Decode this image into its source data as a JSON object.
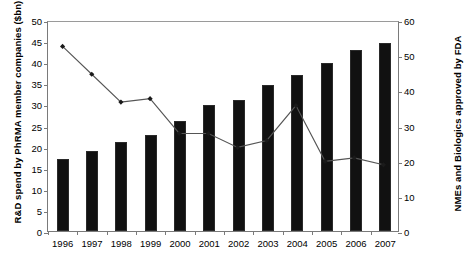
{
  "chart_data": {
    "type": "bar",
    "title": "",
    "categories": [
      "1996",
      "1997",
      "1998",
      "1999",
      "2000",
      "2001",
      "2002",
      "2003",
      "2004",
      "2005",
      "2006",
      "2007"
    ],
    "xlabel": "",
    "ylabel": "R&D spend by PhRMA member companies ($bn)",
    "ylabel_right": "NMEs and Biologics approved by FDA",
    "ylim": [
      0,
      50
    ],
    "ylim_right": [
      0,
      60
    ],
    "yticks": [
      0,
      5,
      10,
      15,
      20,
      25,
      30,
      35,
      40,
      45,
      50
    ],
    "yticks_right": [
      0,
      10,
      20,
      30,
      40,
      50,
      60
    ],
    "grid": false,
    "legend": false,
    "series": [
      {
        "name": "R&D spend by PhRMA member companies ($bn)",
        "type": "bar",
        "axis": "left",
        "color": "#111111",
        "values": [
          17.0,
          19.0,
          21.0,
          22.7,
          26.0,
          29.8,
          31.0,
          34.5,
          37.0,
          39.9,
          43.0,
          44.5
        ]
      },
      {
        "name": "NMEs and Biologics approved by FDA",
        "type": "line",
        "axis": "right",
        "color": "#555555",
        "marker": "diamond",
        "values": [
          53,
          45,
          37,
          38,
          28,
          28,
          24,
          26,
          36,
          20,
          21,
          19
        ]
      }
    ]
  }
}
